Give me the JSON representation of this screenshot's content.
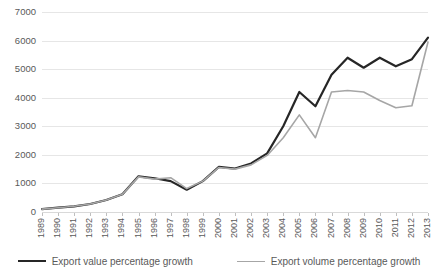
{
  "chart_data": {
    "type": "line",
    "title": "",
    "xlabel": "",
    "ylabel": "",
    "ylim": [
      0,
      7000
    ],
    "ytick_step": 1000,
    "grid": true,
    "legend_position": "bottom",
    "categories": [
      "1989",
      "1990",
      "1991",
      "1992",
      "1993",
      "1994",
      "1995",
      "1996",
      "1997",
      "1998",
      "1999",
      "2000",
      "2001",
      "2002",
      "2003",
      "2004",
      "2005",
      "2006",
      "2007",
      "2008",
      "2009",
      "2010",
      "2011",
      "2012",
      "2013"
    ],
    "yticks": [
      "0",
      "1000",
      "2000",
      "3000",
      "4000",
      "5000",
      "6000",
      "7000"
    ],
    "series": [
      {
        "name": "Export value percentage growth",
        "color": "#262626",
        "values": [
          100,
          150,
          200,
          280,
          420,
          620,
          1250,
          1180,
          1080,
          780,
          1080,
          1580,
          1520,
          1700,
          2050,
          3000,
          4200,
          3700,
          4800,
          5400,
          5050,
          5400,
          5100,
          5350,
          6100
        ]
      },
      {
        "name": "Export volume percentage growth",
        "color": "#A6A6A6",
        "values": [
          100,
          150,
          200,
          280,
          420,
          620,
          1230,
          1150,
          1200,
          820,
          1080,
          1560,
          1500,
          1650,
          1980,
          2600,
          3400,
          2600,
          4200,
          4250,
          4200,
          3900,
          3650,
          3720,
          5950
        ]
      }
    ]
  },
  "legend": {
    "items": [
      {
        "label": "Export value percentage growth"
      },
      {
        "label": "Export volume percentage growth"
      }
    ]
  }
}
